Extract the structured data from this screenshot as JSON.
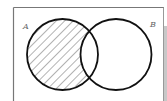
{
  "diagram": {
    "type": "venn",
    "sets": [
      {
        "label": "A",
        "shaded": "A \\ B"
      },
      {
        "label": "B",
        "shaded": "none"
      }
    ],
    "shaded_region": "A minus B",
    "colors": {
      "stroke": "#111111",
      "frame": "#777777",
      "hatch": "#555555",
      "background": "#ffffff"
    }
  },
  "labels": {
    "set_a": "A",
    "set_b": "B"
  }
}
